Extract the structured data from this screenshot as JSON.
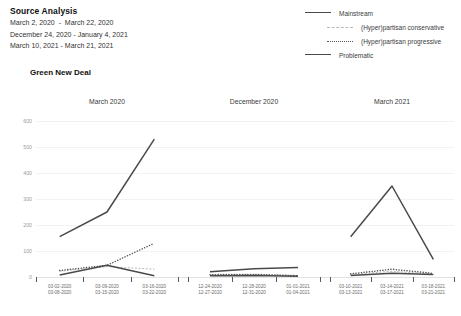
{
  "header": {
    "title": "Source Analysis",
    "ranges": [
      "March 2, 2020  -  March 22, 2020",
      "December 24, 2020 - January 4, 2021",
      "March 10, 2021 - March 21, 2021"
    ]
  },
  "legend": {
    "items": [
      {
        "label": "Mainstream",
        "style": "solid",
        "color": "#4a4a4a",
        "indent": false
      },
      {
        "label": "(Hyper)partisan conservative",
        "style": "fine",
        "color": "#b9b9b9",
        "indent": true
      },
      {
        "label": "(Hyper)partisan progressive",
        "style": "dotted",
        "color": "#555555",
        "indent": true
      },
      {
        "label": "Problematic",
        "style": "solid",
        "color": "#4a4a4a",
        "indent": false
      }
    ]
  },
  "chart_data": {
    "type": "line",
    "title": "Green New Deal",
    "xlabel": "",
    "ylabel": "",
    "ylim": [
      0,
      600
    ],
    "yticks": [
      600,
      500,
      400,
      300,
      200,
      100,
      0
    ],
    "grid": true,
    "legend_position": "top-right",
    "panels": [
      {
        "title": "March 2020",
        "categories": [
          "03-02-2020\n03-08-2020",
          "03-09-2020\n03-15-2020",
          "03-16-2020\n03-22-2020"
        ],
        "tick_count": 4,
        "series": [
          {
            "name": "Mainstream",
            "style": "solid",
            "color": "#4a4a4a",
            "values": [
              155,
              250,
              530
            ]
          },
          {
            "name": "(Hyper)partisan conservative",
            "style": "fine",
            "color": "#b9b9b9",
            "values": [
              22,
              40,
              30
            ]
          },
          {
            "name": "(Hyper)partisan progressive",
            "style": "dotted",
            "color": "#555555",
            "values": [
              25,
              45,
              130
            ]
          },
          {
            "name": "Problematic",
            "style": "solid",
            "color": "#4a4a4a",
            "values": [
              8,
              45,
              5
            ]
          }
        ]
      },
      {
        "title": "December 2020",
        "categories": [
          "12-24-2020\n12-27-2020",
          "12-28-2020\n12-31-2020",
          "01-01-2021\n01-04-2021"
        ],
        "tick_count": 4,
        "series": [
          {
            "name": "Mainstream",
            "style": "solid",
            "color": "#4a4a4a",
            "values": [
              20,
              32,
              37
            ]
          },
          {
            "name": "(Hyper)partisan conservative",
            "style": "fine",
            "color": "#b9b9b9",
            "values": [
              8,
              9,
              6
            ]
          },
          {
            "name": "(Hyper)partisan progressive",
            "style": "dotted",
            "color": "#555555",
            "values": [
              9,
              10,
              5
            ]
          },
          {
            "name": "Problematic",
            "style": "solid",
            "color": "#4a4a4a",
            "values": [
              5,
              6,
              3
            ]
          }
        ]
      },
      {
        "title": "March 2021",
        "categories": [
          "03-10-2021\n03-13-2021",
          "03-14-2021\n03-17-2021",
          "03-18-2021\n03-21-2021"
        ],
        "tick_count": 4,
        "series": [
          {
            "name": "Mainstream",
            "style": "solid",
            "color": "#4a4a4a",
            "values": [
              155,
              350,
              68
            ]
          },
          {
            "name": "(Hyper)partisan conservative",
            "style": "fine",
            "color": "#b9b9b9",
            "values": [
              10,
              22,
              12
            ]
          },
          {
            "name": "(Hyper)partisan progressive",
            "style": "dotted",
            "color": "#555555",
            "values": [
              12,
              30,
              14
            ]
          },
          {
            "name": "Problematic",
            "style": "solid",
            "color": "#4a4a4a",
            "values": [
              6,
              14,
              10
            ]
          }
        ]
      }
    ]
  }
}
